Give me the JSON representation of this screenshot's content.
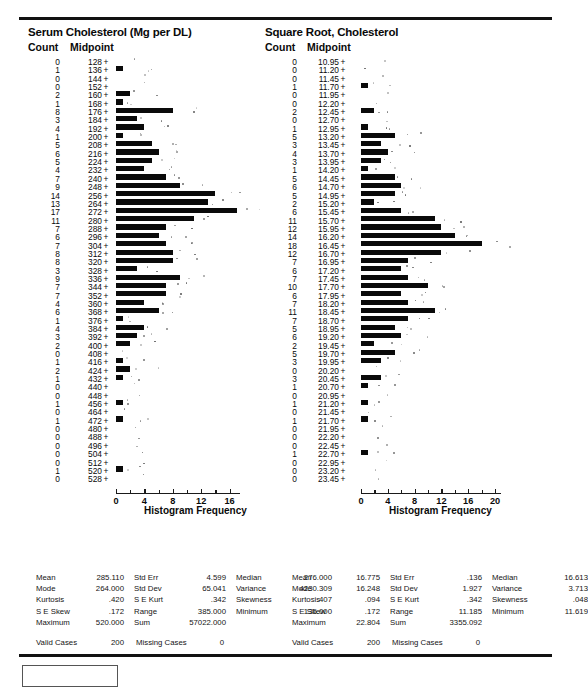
{
  "chart_data": [
    {
      "type": "bar",
      "orientation": "horizontal",
      "title": "Serum Cholesterol (Mg per DL)",
      "xlabel": "Histogram Frequency",
      "ylabel": "Midpoint",
      "count_header": "Count",
      "midpoint_header": "Midpoint",
      "xlim": [
        0,
        17.5
      ],
      "xticks": [
        0,
        4,
        8,
        12,
        16
      ],
      "grid": false,
      "categories": [
        128,
        136,
        144,
        152,
        160,
        168,
        176,
        184,
        192,
        200,
        208,
        216,
        224,
        232,
        240,
        248,
        256,
        264,
        272,
        280,
        288,
        296,
        304,
        312,
        320,
        328,
        336,
        344,
        352,
        360,
        368,
        376,
        384,
        392,
        400,
        408,
        416,
        424,
        432,
        440,
        448,
        456,
        464,
        472,
        480,
        488,
        496,
        504,
        512,
        520,
        528
      ],
      "values": [
        0,
        1,
        0,
        0,
        2,
        1,
        8,
        3,
        4,
        1,
        5,
        6,
        5,
        4,
        7,
        9,
        14,
        13,
        17,
        11,
        7,
        6,
        7,
        8,
        8,
        3,
        9,
        7,
        7,
        4,
        6,
        1,
        4,
        3,
        2,
        0,
        1,
        2,
        1,
        0,
        0,
        1,
        0,
        1,
        0,
        0,
        0,
        0,
        0,
        1,
        0
      ]
    },
    {
      "type": "bar",
      "orientation": "horizontal",
      "title": "Square Root, Cholesterol",
      "xlabel": "Histogram Frequency",
      "ylabel": "Midpoint",
      "count_header": "Count",
      "midpoint_header": "Midpoint",
      "xlim": [
        0,
        21
      ],
      "xticks": [
        0,
        4,
        8,
        12,
        16,
        20
      ],
      "grid": false,
      "categories": [
        "10.95",
        "11.20",
        "11.45",
        "11.70",
        "11.95",
        "12.20",
        "12.45",
        "12.70",
        "12.95",
        "13.20",
        "13.45",
        "13.70",
        "13.95",
        "14.20",
        "14.45",
        "14.70",
        "14.95",
        "15.20",
        "15.45",
        "15.70",
        "15.95",
        "16.20",
        "16.45",
        "16.70",
        "16.95",
        "17.20",
        "17.45",
        "17.70",
        "17.95",
        "18.20",
        "18.45",
        "18.70",
        "18.95",
        "19.20",
        "19.45",
        "19.70",
        "19.95",
        "20.20",
        "20.45",
        "20.70",
        "20.95",
        "21.20",
        "21.45",
        "21.70",
        "21.95",
        "22.20",
        "22.45",
        "22.70",
        "22.95",
        "23.20",
        "23.45"
      ],
      "values": [
        0,
        0,
        0,
        1,
        0,
        0,
        2,
        0,
        1,
        5,
        3,
        4,
        3,
        1,
        5,
        6,
        5,
        2,
        6,
        11,
        12,
        14,
        18,
        12,
        7,
        6,
        7,
        10,
        6,
        7,
        11,
        7,
        5,
        6,
        2,
        5,
        3,
        0,
        3,
        1,
        0,
        1,
        0,
        1,
        0,
        0,
        0,
        1,
        0,
        0,
        0
      ]
    }
  ],
  "left_panel": {
    "stats": {
      "rows": [
        {
          "l1": "Mean",
          "v1": "285.110",
          "l2": "Std Err",
          "v2": "4.599",
          "l3": "Median",
          "v3": "276.000"
        },
        {
          "l1": "Mode",
          "v1": "264.000",
          "l2": "Std Dev",
          "v2": "65.041",
          "l3": "Variance",
          "v3": "4230.309"
        },
        {
          "l1": "Kurtosis",
          "v1": ".420",
          "l2": "S E Kurt",
          "v2": ".342",
          "l3": "Skewness",
          "v3": ".407"
        },
        {
          "l1": "S E Skew",
          "v1": ".172",
          "l2": "Range",
          "v2": "385.000",
          "l3": "Minimum",
          "v3": "135.000"
        },
        {
          "l1": "Maximum",
          "v1": "520.000",
          "l2": "Sum",
          "v2": "57022.000",
          "l3": "",
          "v3": ""
        }
      ],
      "valid_label": "Valid Cases",
      "valid_value": "200",
      "missing_label": "Missing Cases",
      "missing_value": "0"
    }
  },
  "right_panel": {
    "stats": {
      "rows": [
        {
          "l1": "Mean",
          "v1": "16.775",
          "l2": "Std Err",
          "v2": ".136",
          "l3": "Median",
          "v3": "16.613"
        },
        {
          "l1": "Mode",
          "v1": "16.248",
          "l2": "Std Dev",
          "v2": "1.927",
          "l3": "Variance",
          "v3": "3.713"
        },
        {
          "l1": "Kurtosis",
          "v1": ".094",
          "l2": "S E Kurt",
          "v2": ".342",
          "l3": "Skewness",
          "v3": ".048"
        },
        {
          "l1": "S E Skew",
          "v1": ".172",
          "l2": "Range",
          "v2": "11.185",
          "l3": "Minimum",
          "v3": "11.619"
        },
        {
          "l1": "Maximum",
          "v1": "22.804",
          "l2": "Sum",
          "v2": "3355.092",
          "l3": "",
          "v3": ""
        }
      ],
      "valid_label": "Valid Cases",
      "valid_value": "200",
      "missing_label": "Missing Cases",
      "missing_value": "0"
    }
  },
  "colors": {
    "bar": "#0a0a0a",
    "rule": "#111111",
    "text": "#0a0a0a"
  }
}
